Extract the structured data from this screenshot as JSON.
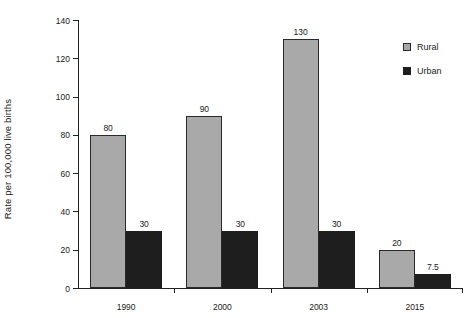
{
  "chart_data": {
    "type": "bar",
    "title": "",
    "xlabel": "",
    "ylabel": "Rate per 100,000 live births",
    "categories": [
      "1990",
      "2000",
      "2003",
      "2015"
    ],
    "ylim": [
      0,
      140
    ],
    "yticks": [
      0,
      20,
      40,
      60,
      80,
      100,
      120,
      140
    ],
    "ytick_labels": [
      "0",
      "20",
      "40",
      "60",
      "80",
      "100",
      "120",
      "140"
    ],
    "grid": false,
    "legend_position": "top-right",
    "series": [
      {
        "name": "Rural",
        "color": "#a9a9a9",
        "values": [
          80,
          90,
          130,
          20
        ],
        "value_labels": [
          "80",
          "90",
          "130",
          "20"
        ]
      },
      {
        "name": "Urban",
        "color": "#1e1e1e",
        "values": [
          30,
          30,
          30,
          7.5
        ],
        "value_labels": [
          "30",
          "30",
          "30",
          "7.5"
        ]
      }
    ]
  },
  "legend": {
    "items": [
      {
        "label": "Rural",
        "swatch": "rural-swatch-icon"
      },
      {
        "label": "Urban",
        "swatch": "urban-swatch-icon"
      }
    ]
  }
}
